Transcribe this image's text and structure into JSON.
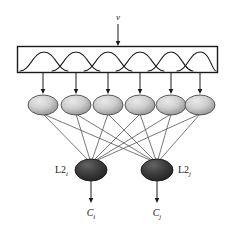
{
  "figure": {
    "input": {
      "label": "v",
      "arrow": "down-arrow"
    },
    "receptive_field_box": {
      "name": "tuning-curve-box",
      "curve_count": 6,
      "curve_shape": "bell",
      "box": {
        "x": 17,
        "y": 46,
        "width": 201,
        "height": 27
      },
      "stroke": "#1a1a1a",
      "fill": "#ffffff"
    },
    "layer1": {
      "name": "L1",
      "node_count": 6,
      "node_fill_light": "#d9d9d9",
      "node_fill_dark": "#8f8f8f",
      "nodes": [
        {
          "id": "l1-node-1",
          "cx": 43,
          "cy": 105
        },
        {
          "id": "l1-node-2",
          "cx": 76,
          "cy": 105
        },
        {
          "id": "l1-node-3",
          "cx": 108,
          "cy": 105
        },
        {
          "id": "l1-node-4",
          "cx": 140,
          "cy": 105
        },
        {
          "id": "l1-node-5",
          "cx": 171,
          "cy": 105
        },
        {
          "id": "l1-node-6",
          "cx": 200,
          "cy": 105
        }
      ],
      "node_rx": 15,
      "node_ry": 10
    },
    "layer2": {
      "name": "L2",
      "node_fill_light": "#5a5a5a",
      "node_fill_dark": "#272727",
      "node_rx": 16,
      "node_ry": 11,
      "nodes": [
        {
          "id": "l2-node-i",
          "label": "L2",
          "subscript": "i",
          "cx": 91,
          "cy": 170,
          "label_side": "left"
        },
        {
          "id": "l2-node-j",
          "label": "L2",
          "subscript": "j",
          "cx": 157,
          "cy": 170,
          "label_side": "right"
        }
      ]
    },
    "outputs": [
      {
        "id": "output-c-i",
        "label": "C",
        "subscript": "i",
        "x": 91,
        "y": 214
      },
      {
        "id": "output-c-j",
        "label": "C",
        "subscript": "j",
        "x": 157,
        "y": 214
      }
    ],
    "colors": {
      "stroke": "#1a1a1a",
      "line": "#555555",
      "background": "#ffffff"
    }
  }
}
